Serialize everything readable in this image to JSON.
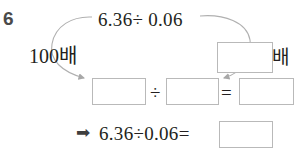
{
  "problem": {
    "number": "6",
    "top_expression": "6.36÷ 0.06",
    "left_label": "100배",
    "right_label_suffix": "배",
    "middle_row": {
      "divide_symbol": "÷",
      "equals_symbol": "=",
      "box1_value": "",
      "box2_value": "",
      "box3_value": ""
    },
    "bottom_row": {
      "arrow_icon": "➡",
      "expression": "6.36÷0.06=",
      "answer_value": ""
    },
    "multiplier_box_value": ""
  },
  "colors": {
    "page_background": "#ffffff",
    "text": "#231f20",
    "question_number": "#4a4a4a",
    "box_border": "#b9b9b9",
    "curve_stroke": "#b0b0b0",
    "arrow_glyph": "#3f3f3f"
  }
}
